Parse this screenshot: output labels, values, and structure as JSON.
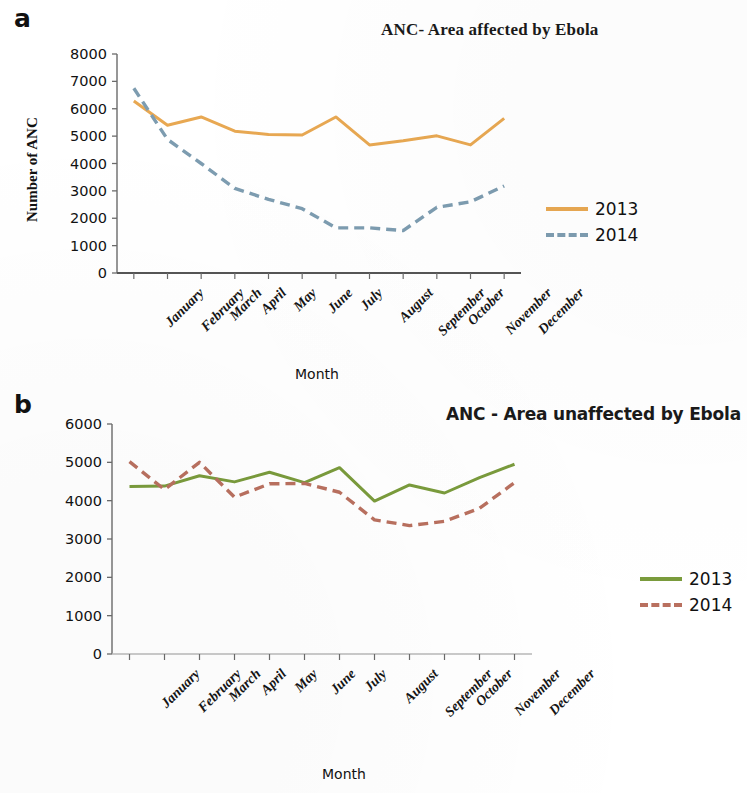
{
  "figure": {
    "panels": [
      {
        "letter": "a",
        "title": "ANC- Area affected by Ebola",
        "ylabel": "Number of ANC",
        "xlabel": "Month"
      },
      {
        "letter": "b",
        "title": "ANC - Area unaffected by Ebola",
        "ylabel": "Number of ANC",
        "xlabel": "Month"
      }
    ]
  },
  "chart_data": [
    {
      "type": "line",
      "panel": "a",
      "title": "ANC- Area affected by Ebola",
      "xlabel": "Month",
      "ylabel": "Number of ANC",
      "categories": [
        "January",
        "February",
        "March",
        "April",
        "May",
        "June",
        "July",
        "August",
        "September",
        "October",
        "November",
        "December"
      ],
      "ylim": [
        0,
        8000
      ],
      "yticks": [
        "0",
        "1000",
        "2000",
        "3000",
        "4000",
        "5000",
        "6000",
        "7000",
        "8000"
      ],
      "grid": false,
      "legend_position": "right",
      "series": [
        {
          "name": "2013",
          "color": "#e8a852",
          "style": "solid",
          "values": [
            6280,
            5400,
            5700,
            5180,
            5060,
            5040,
            5700,
            4680,
            4830,
            5010,
            4680,
            5650
          ]
        },
        {
          "name": "2014",
          "color": "#7d9cb0",
          "style": "dashed",
          "values": [
            6750,
            4880,
            4000,
            3090,
            2690,
            2350,
            1650,
            1650,
            1550,
            2400,
            2600,
            3180
          ]
        }
      ]
    },
    {
      "type": "line",
      "panel": "b",
      "title": "ANC - Area unaffected by Ebola",
      "xlabel": "Month",
      "ylabel": "Number of ANC",
      "categories": [
        "January",
        "February",
        "March",
        "April",
        "May",
        "June",
        "July",
        "August",
        "September",
        "October",
        "November",
        "December"
      ],
      "ylim": [
        0,
        6000
      ],
      "yticks": [
        "0",
        "1000",
        "2000",
        "3000",
        "4000",
        "5000",
        "6000"
      ],
      "grid": false,
      "legend_position": "right",
      "series": [
        {
          "name": "2013",
          "color": "#7a9b3c",
          "style": "solid",
          "values": [
            4370,
            4380,
            4650,
            4490,
            4740,
            4470,
            4860,
            3990,
            4410,
            4200,
            4600,
            4950
          ]
        },
        {
          "name": "2014",
          "color": "#b9705f",
          "style": "dashed",
          "values": [
            5020,
            4290,
            5000,
            4090,
            4440,
            4450,
            4220,
            3500,
            3350,
            3460,
            3800,
            4470
          ]
        }
      ]
    }
  ]
}
